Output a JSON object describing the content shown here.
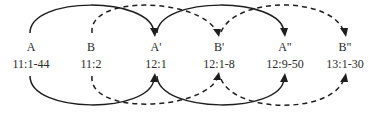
{
  "diagram": {
    "type": "chiastic-arc-structure",
    "nodes": [
      {
        "id": "A",
        "letter": "A",
        "ref": "11:1-44",
        "x": 31
      },
      {
        "id": "B",
        "letter": "B",
        "ref": "11:2",
        "x": 91
      },
      {
        "id": "A1",
        "letter": "A'",
        "ref": "12:1",
        "x": 156
      },
      {
        "id": "B1",
        "letter": "B'",
        "ref": "12:1-8",
        "x": 219
      },
      {
        "id": "A2",
        "letter": "A\"",
        "ref": "12:9-50",
        "x": 285
      },
      {
        "id": "B2",
        "letter": "B\"",
        "ref": "13:1-30",
        "x": 345
      }
    ],
    "connections": [
      {
        "from": "A",
        "to": "A1",
        "style": "solid",
        "sides": [
          "top",
          "bottom"
        ],
        "arrow": "end"
      },
      {
        "from": "A1",
        "to": "A2",
        "style": "solid",
        "sides": [
          "top",
          "bottom"
        ],
        "arrow": "end"
      },
      {
        "from": "B",
        "to": "B1",
        "style": "dashed",
        "sides": [
          "top",
          "bottom"
        ],
        "arrow": "end"
      },
      {
        "from": "B1",
        "to": "B2",
        "style": "dashed",
        "sides": [
          "top",
          "bottom"
        ],
        "arrow": "end"
      }
    ],
    "colors": {
      "line": "#1e1e1e",
      "text": "#2a2a2a",
      "background": "#ffffff"
    }
  }
}
